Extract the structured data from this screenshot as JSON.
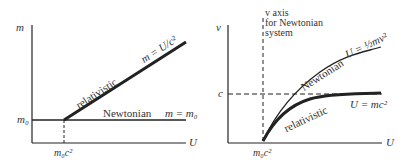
{
  "left_panel": {
    "y_axis_label": "m",
    "x_axis_label": "U",
    "y_tick": "m₀",
    "x_tick": "m₀c²",
    "relativistic_label": "relativistic",
    "relativistic_eq": "m = U/c²",
    "newtonian_label": "Newtonian",
    "newtonian_eq": "m = m₀"
  },
  "right_panel": {
    "y_axis_label": "v",
    "x_axis_label": "U",
    "y_tick": "c",
    "x_tick": "m₀c²",
    "v_axis_note_line1": "v axis",
    "v_axis_note_line2": "for Newtonian",
    "v_axis_note_line3": "system",
    "newtonian_label": "Newtonian",
    "newtonian_eq": "U = ½mv²",
    "relativistic_label": "relativistic",
    "relativistic_eq": "U = mc²"
  },
  "colors": {
    "line": "#222222",
    "background": "#ffffff"
  }
}
